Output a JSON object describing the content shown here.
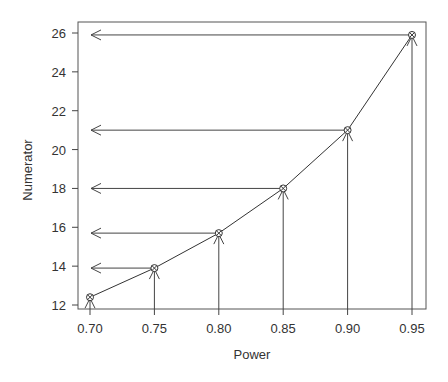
{
  "chart_data": {
    "type": "line",
    "title": "",
    "xlabel": "Power",
    "ylabel": "Numerator",
    "x": [
      0.7,
      0.75,
      0.8,
      0.85,
      0.9,
      0.95
    ],
    "x_tick_labels": [
      "0.70",
      "0.75",
      "0.80",
      "0.85",
      "0.90",
      "0.95"
    ],
    "y_ticks": [
      12,
      14,
      16,
      18,
      20,
      22,
      24,
      26
    ],
    "y_tick_labels": [
      "12",
      "14",
      "16",
      "18",
      "20",
      "22",
      "24",
      "26"
    ],
    "series": [
      {
        "name": "Numerator",
        "values": [
          12.4,
          13.9,
          15.7,
          18.0,
          21.0,
          25.9
        ],
        "marker": "circle-with-cross"
      }
    ],
    "xlim": [
      0.688,
      0.958
    ],
    "ylim": [
      11.8,
      26.6
    ],
    "grid": false,
    "legend": null,
    "annotations": "Vertical arrows from x-axis up to each point; horizontal arrows from each point leftward to x=0.70 (reading numerator off the y-axis)",
    "colors": {
      "line": "#333333",
      "axis": "#444444",
      "text": "#333333"
    }
  }
}
